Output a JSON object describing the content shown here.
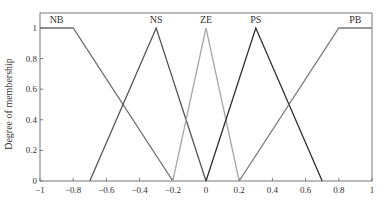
{
  "chart_data": {
    "type": "line",
    "title": "",
    "xlabel": "",
    "ylabel": "Degree of membership",
    "xlim": [
      -1,
      1
    ],
    "ylim": [
      0,
      1
    ],
    "grid": false,
    "legend": "inline labels above peaks",
    "xticks": [
      -1,
      -0.8,
      -0.6,
      -0.4,
      -0.2,
      0,
      0.2,
      0.4,
      0.6,
      0.8,
      1
    ],
    "xtick_labels": [
      "−1",
      "−0.8",
      "−0.6",
      "−0.4",
      "−0.2",
      "0",
      "0.2",
      "0.4",
      "0.6",
      "0.8",
      "1"
    ],
    "yticks": [
      0,
      0.2,
      0.4,
      0.6,
      0.8,
      1
    ],
    "ytick_labels": [
      "0",
      "0.2",
      "0.4",
      "0.6",
      "0.8",
      "1"
    ],
    "series": [
      {
        "name": "NB",
        "color": "#6e6e6e",
        "x": [
          -1,
          -0.8,
          -0.2
        ],
        "y": [
          1,
          1,
          0
        ],
        "label_x": -0.9
      },
      {
        "name": "NS",
        "color": "#555555",
        "x": [
          -0.7,
          -0.3,
          0
        ],
        "y": [
          0,
          1,
          0
        ],
        "label_x": -0.3
      },
      {
        "name": "ZE",
        "color": "#a8a8a8",
        "x": [
          -0.2,
          0,
          0.2
        ],
        "y": [
          0,
          1,
          0
        ],
        "label_x": 0
      },
      {
        "name": "PS",
        "color": "#2e2e2e",
        "x": [
          0,
          0.3,
          0.7
        ],
        "y": [
          0,
          1,
          0
        ],
        "label_x": 0.3
      },
      {
        "name": "PB",
        "color": "#7a7a7a",
        "x": [
          0.2,
          0.8,
          1
        ],
        "y": [
          0,
          1,
          1
        ],
        "label_x": 0.9
      }
    ]
  }
}
